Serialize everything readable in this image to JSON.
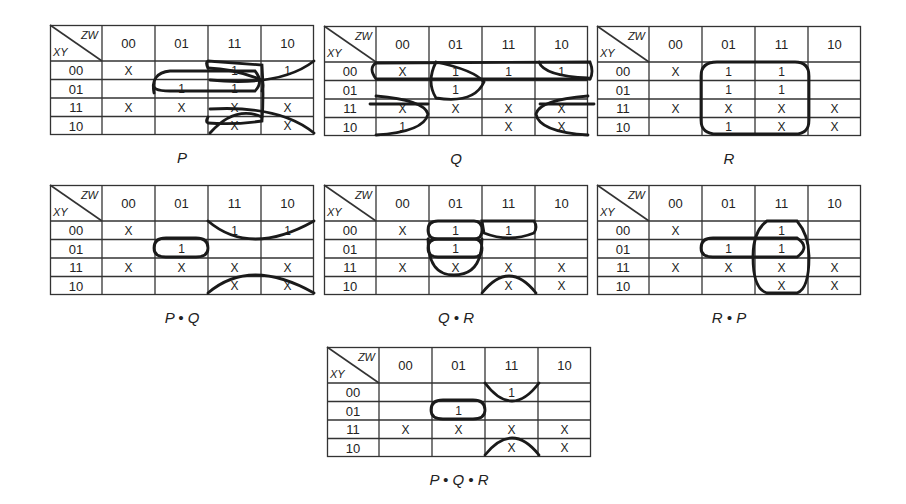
{
  "row_header": "XY",
  "col_header": "ZW",
  "column_labels": [
    "00",
    "01",
    "11",
    "10"
  ],
  "row_labels": [
    "00",
    "01",
    "11",
    "10"
  ],
  "maps": [
    {
      "id": "P",
      "caption": "P",
      "pos": [
        50,
        25
      ],
      "cells": [
        [
          "X",
          "",
          "1",
          "1"
        ],
        [
          "",
          "1",
          "1",
          ""
        ],
        [
          "X",
          "X",
          "X",
          "X"
        ],
        [
          "",
          "",
          "X",
          "X"
        ]
      ],
      "loops": [
        "M 158 43 Q 155 37 158 36 Q 184 38 212 40 Q 214 70 212 96 Q 184 100 158 98 Q 155 97 158 92",
        "M 158 43 Q 185 44 212 55 Q 214 60 212 66",
        "M 104 68 Q 100 48 120 46 L 205 46 Q 214 57 205 66 L 120 66 Q 100 66 104 58",
        "M 264 36 Q 230 62 160 55",
        "M 264 108 Q 230 80 160 84",
        "M 160 108 Q 185 80 212 92"
      ]
    },
    {
      "id": "Q",
      "caption": "Q",
      "pos": [
        324,
        26
      ],
      "cells": [
        [
          "X",
          "1",
          "1",
          "1"
        ],
        [
          "",
          "1",
          "",
          ""
        ],
        [
          "X",
          "X",
          "X",
          "X"
        ],
        [
          "1",
          "",
          "X",
          "X"
        ]
      ],
      "loops": [
        "M 52 37 Q 44 42 52 53 L 266 53",
        "M 52 37 L 266 36 Q 270 46 266 53",
        "M 112 36 Q 150 44 160 56 Q 150 78 112 72 Q 102 56 112 36",
        "M 215 36 Q 220 50 264 52",
        "M 52 70 Q 100 74 104 88 Q 100 106 52 109",
        "M 46 78 L 104 78",
        "M 264 70 Q 215 74 212 88 Q 215 106 264 109",
        "M 216 78 L 270 78"
      ]
    },
    {
      "id": "R",
      "caption": "R",
      "pos": [
        597,
        26
      ],
      "cells": [
        [
          "X",
          "1",
          "1",
          ""
        ],
        [
          "",
          "1",
          "1",
          ""
        ],
        [
          "X",
          "X",
          "X",
          "X"
        ],
        [
          "",
          "1",
          "X",
          "X"
        ]
      ],
      "loops": [
        "M 104 50 Q 104 36 120 36 L 198 36 Q 212 36 212 50 L 212 94 Q 212 108 198 108 L 120 108 Q 104 108 104 94 Z"
      ]
    },
    {
      "id": "PQ",
      "caption": "P • Q",
      "pos": [
        50,
        185
      ],
      "cells": [
        [
          "X",
          "",
          "1",
          "1"
        ],
        [
          "",
          "1",
          "",
          ""
        ],
        [
          "X",
          "X",
          "X",
          "X"
        ],
        [
          "",
          "",
          "X",
          "X"
        ]
      ],
      "loops": [
        "M 158 36 Q 200 72 264 36",
        "M 158 108 Q 200 72 264 108",
        "M 116 53 L 146 53 Q 158 53 158 63 Q 158 72 146 72 L 116 72 Q 104 72 104 63 Q 104 53 116 53 Z"
      ]
    },
    {
      "id": "QR",
      "caption": "Q • R",
      "pos": [
        324,
        185
      ],
      "cells": [
        [
          "X",
          "1",
          "1",
          ""
        ],
        [
          "",
          "1",
          "",
          ""
        ],
        [
          "X",
          "X",
          "X",
          "X"
        ],
        [
          "",
          "",
          "X",
          "X"
        ]
      ],
      "loops": [
        "M 114 36 L 150 36 Q 158 36 158 45 Q 158 54 150 54 L 114 54 Q 104 54 104 45 Q 104 36 114 36 Z",
        "M 114 54 L 150 54 Q 158 54 158 63 Q 158 72 150 72 L 114 72 Q 104 72 104 63 Q 104 54 114 54 Z",
        "M 104 54 Q 104 90 130 90 Q 158 90 158 54",
        "M 158 36 L 210 36 Q 214 42 210 48 Q 185 58 160 48 Z",
        "M 158 108 Q 185 74 212 108"
      ]
    },
    {
      "id": "RP",
      "caption": "R • P",
      "pos": [
        597,
        185
      ],
      "cells": [
        [
          "X",
          "",
          "1",
          ""
        ],
        [
          "",
          "1",
          "1",
          ""
        ],
        [
          "X",
          "X",
          "X",
          "X"
        ],
        [
          "",
          "",
          "X",
          "X"
        ]
      ],
      "loops": [
        "M 170 36 L 200 36 Q 212 50 212 72 Q 212 104 200 108 L 170 108 Q 156 104 156 72 Q 156 46 170 36 Z",
        "M 116 53 L 200 53 Q 214 62 200 72 L 116 72 Q 104 72 104 63 Q 104 53 116 53 Z"
      ]
    },
    {
      "id": "PQR",
      "caption": "P • Q • R",
      "pos": [
        327,
        347
      ],
      "cells": [
        [
          "",
          "",
          "1",
          ""
        ],
        [
          "",
          "1",
          "",
          ""
        ],
        [
          "X",
          "X",
          "X",
          "X"
        ],
        [
          "",
          "",
          "X",
          "X"
        ]
      ],
      "loops": [
        "M 158 36 Q 185 72 212 36",
        "M 158 108 Q 185 74 212 108",
        "M 116 53 L 146 53 Q 158 53 158 63 Q 158 72 146 72 L 116 72 Q 104 72 104 63 Q 104 53 116 53 Z"
      ]
    }
  ]
}
